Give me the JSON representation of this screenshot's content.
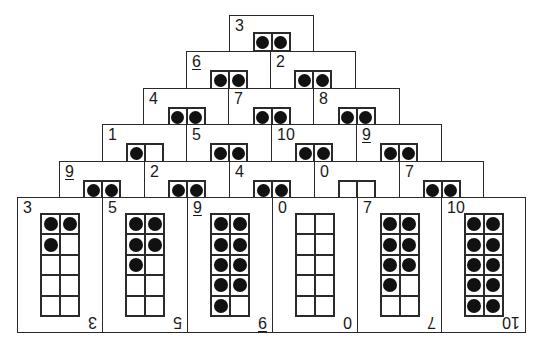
{
  "colors": {
    "ink": "#1a1a1a",
    "card": "#ffffff",
    "dot": "#111111"
  },
  "rows": [
    {
      "top": 15,
      "height": 35,
      "cards": [
        {
          "value": "3",
          "underline": false,
          "left": 229,
          "width": 85,
          "dots": 2
        }
      ]
    },
    {
      "top": 51,
      "height": 37,
      "cards": [
        {
          "value": "6",
          "underline": true,
          "left": 186,
          "width": 86,
          "dots": 2
        },
        {
          "value": "2",
          "underline": false,
          "left": 270,
          "width": 86,
          "dots": 2
        }
      ]
    },
    {
      "top": 88,
      "height": 37,
      "cards": [
        {
          "value": "4",
          "underline": false,
          "left": 143,
          "width": 87,
          "dots": 2
        },
        {
          "value": "7",
          "underline": false,
          "left": 228,
          "width": 87,
          "dots": 2
        },
        {
          "value": "8",
          "underline": false,
          "left": 313,
          "width": 87,
          "dots": 2
        }
      ]
    },
    {
      "top": 124,
      "height": 37,
      "cards": [
        {
          "value": "1",
          "underline": false,
          "left": 102,
          "width": 86,
          "dots": 1
        },
        {
          "value": "5",
          "underline": false,
          "left": 186,
          "width": 86,
          "dots": 2
        },
        {
          "value": "10",
          "underline": false,
          "left": 271,
          "width": 86,
          "dots": 2
        },
        {
          "value": "9",
          "underline": true,
          "left": 356,
          "width": 86,
          "dots": 2
        }
      ]
    },
    {
      "top": 161,
      "height": 37,
      "cards": [
        {
          "value": "9",
          "underline": true,
          "left": 59,
          "width": 86,
          "dots": 2
        },
        {
          "value": "2",
          "underline": false,
          "left": 144,
          "width": 86,
          "dots": 2
        },
        {
          "value": "4",
          "underline": false,
          "left": 229,
          "width": 86,
          "dots": 2
        },
        {
          "value": "0",
          "underline": false,
          "left": 314,
          "width": 86,
          "dots": 0
        },
        {
          "value": "7",
          "underline": false,
          "left": 399,
          "width": 85,
          "dots": 2
        }
      ]
    }
  ],
  "bottom_row": {
    "top": 197,
    "height": 136,
    "cards": [
      {
        "value": "3",
        "underline": false,
        "left": 17,
        "width": 86,
        "dots": 3
      },
      {
        "value": "5",
        "underline": false,
        "left": 102,
        "width": 86,
        "dots": 5
      },
      {
        "value": "9",
        "underline": true,
        "left": 187,
        "width": 86,
        "dots": 9
      },
      {
        "value": "0",
        "underline": false,
        "left": 272,
        "width": 86,
        "dots": 0
      },
      {
        "value": "7",
        "underline": false,
        "left": 357,
        "width": 85,
        "dots": 7
      },
      {
        "value": "10",
        "underline": false,
        "left": 441,
        "width": 85,
        "dots": 10
      }
    ]
  }
}
